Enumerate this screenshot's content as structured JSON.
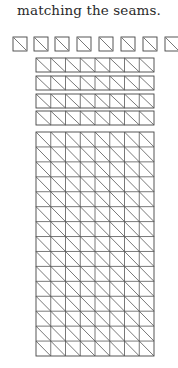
{
  "caption": "matching the seams.",
  "diagram": {
    "loose_squares": {
      "count": 8,
      "top": 37,
      "size": 14,
      "lefts": [
        13,
        34,
        55,
        77,
        99,
        121,
        143,
        165
      ]
    },
    "strips": {
      "count": 4,
      "left": 36,
      "right": 154,
      "columns": 8,
      "tops": [
        58,
        76,
        94,
        111
      ],
      "height": 14
    },
    "assembled_grid": {
      "left": 36,
      "right": 154,
      "top": 132,
      "bottom": 356,
      "columns": 8,
      "rows": 15
    },
    "line_color": "#555555"
  }
}
